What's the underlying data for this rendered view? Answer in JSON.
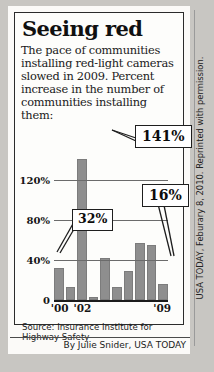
{
  "headline": "Seeing red",
  "deck": "The pace of communities installing red-light cameras slowed in 2009. Percent increase in the number of communities installing them:",
  "source": "Source: Insurance Institute for Highway Safety",
  "byline": "By Julie Snider, USA TODAY",
  "credit": "USA TODAY, Feburary 8, 2010. Reprinted with permission.",
  "colors": {
    "bar": "#8e8e8e",
    "axis": "#1c1c1c",
    "grid": "#6b6b6b",
    "paper": "#fdfdfb",
    "background": "#c8c6c2"
  },
  "chart_data": {
    "type": "bar",
    "title": "Seeing red",
    "xlabel": "",
    "ylabel": "",
    "ylim": [
      0,
      160
    ],
    "grid": true,
    "legend": false,
    "categories": [
      "'00",
      "'01",
      "'02",
      "'03",
      "'04",
      "'05",
      "'06",
      "'07",
      "'08",
      "'09"
    ],
    "values": [
      32,
      13,
      141,
      3,
      42,
      13,
      29,
      57,
      55,
      16
    ],
    "ytick_labels": [
      "0",
      "40%",
      "80%",
      "120%"
    ],
    "ytick_values": [
      0,
      40,
      80,
      120
    ],
    "xtick_labels": [
      "'00",
      "'02",
      "'09"
    ],
    "xtick_indices": [
      0,
      2,
      9
    ],
    "annotations": [
      {
        "label": "32%",
        "category": "'00",
        "value": 32
      },
      {
        "label": "141%",
        "category": "'02",
        "value": 141
      },
      {
        "label": "16%",
        "category": "'09",
        "value": 16
      }
    ]
  }
}
